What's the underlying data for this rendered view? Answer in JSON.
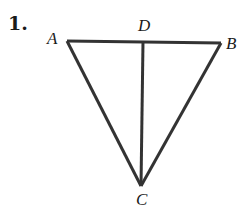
{
  "problem_number": "1.",
  "figure": {
    "type": "triangle-with-segment",
    "points": {
      "A": {
        "label": "A",
        "x": 67,
        "y": 41
      },
      "B": {
        "label": "B",
        "x": 221,
        "y": 43
      },
      "C": {
        "label": "C",
        "x": 141,
        "y": 186
      },
      "D": {
        "label": "D",
        "x": 143,
        "y": 42
      }
    },
    "segments": [
      "AB",
      "AC",
      "BC",
      "CD"
    ],
    "stroke_color": "#333333"
  }
}
